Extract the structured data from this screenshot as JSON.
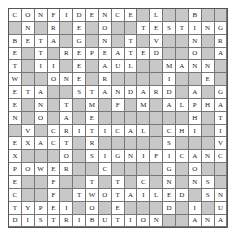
{
  "puzzle": {
    "type": "crossword",
    "rows": 17,
    "cols": 17,
    "block_color": "#c8c8c8",
    "cell_color": "#ffffff",
    "grid": [
      "CONFIDENCE#L##B##",
      "#N#R#E#O##TESTING",
      "BETA#G#N#T#V#N#R#",
      "E#T#REPEATED#O#A#",
      "T#II#E#AUL##MANN",
      "W##ONE#R#####I#E",
      "ETA##STANDARD#A#G",
      "E#N#T#M#F#M#ALPHA",
      "N#O#A#E#######H#T",
      "#V#CRITICAL#CHI#I",
      "EXACT#R######S##V",
      "X###O#SIGNIFICANCE",
      "POWER##C####G#O##",
      "E##F##T#T#C#N#NS#",
      "C##F#TWOTAILED#S#N",
      "TYPEI#O#E###D#I#U",
      "E##C##S#######G#L"
    ],
    "rows_text": [
      [
        "C",
        "O",
        "N",
        "F",
        "I",
        "D",
        "E",
        "N",
        "C",
        "E",
        "#",
        "L",
        "#",
        "#",
        "B",
        "#",
        "#"
      ],
      [
        "#",
        "N",
        "#",
        "R",
        "#",
        "E",
        "#",
        "O",
        "#",
        "#",
        "T",
        "E",
        "S",
        "T",
        "I",
        "N",
        "G"
      ],
      [
        "B",
        "E",
        "T",
        "A",
        "#",
        "G",
        "#",
        "N",
        "#",
        "T",
        "#",
        "V",
        "#",
        "#",
        "N",
        "#",
        "R"
      ],
      [
        "E",
        "#",
        "T",
        "#",
        "R",
        "E",
        "P",
        "E",
        "A",
        "T",
        "E",
        "D",
        "#",
        "#",
        "O",
        "#",
        "A"
      ],
      [
        "T",
        "#",
        "I",
        "I",
        "#",
        "E",
        "#",
        "A",
        "U",
        "L",
        "#",
        "#",
        "M",
        "A",
        "N",
        "N",
        "#"
      ],
      [
        "W",
        "#",
        "#",
        "O",
        "N",
        "E",
        "#",
        "R",
        "#",
        "#",
        "#",
        "#",
        "I",
        "#",
        "#",
        "E",
        "#"
      ],
      [
        "E",
        "T",
        "A",
        "#",
        "#",
        "S",
        "T",
        "A",
        "N",
        "D",
        "A",
        "R",
        "D",
        "#",
        "A",
        "#",
        "G"
      ],
      [
        "E",
        "#",
        "N",
        "#",
        "T",
        "#",
        "M",
        "#",
        "F",
        "#",
        "M",
        "#",
        "A",
        "L",
        "P",
        "H",
        "A"
      ],
      [
        "N",
        "#",
        "O",
        "#",
        "A",
        "#",
        "E",
        "#",
        "#",
        "#",
        "#",
        "#",
        "#",
        "#",
        "H",
        "#",
        "T"
      ],
      [
        "#",
        "V",
        "#",
        "C",
        "R",
        "I",
        "T",
        "I",
        "C",
        "A",
        "L",
        "#",
        "C",
        "H",
        "I",
        "#",
        "I"
      ],
      [
        "E",
        "X",
        "A",
        "C",
        "T",
        "#",
        "R",
        "#",
        "#",
        "#",
        "#",
        "#",
        "S",
        "#",
        "#",
        "#",
        "V"
      ],
      [
        "X",
        "#",
        "#",
        "#",
        "O",
        "#",
        "S",
        "I",
        "G",
        "N",
        "I",
        "F",
        "I",
        "C",
        "A",
        "N",
        "C"
      ],
      [
        "P",
        "O",
        "W",
        "E",
        "R",
        "#",
        "#",
        "C",
        "#",
        "#",
        "#",
        "#",
        "G",
        "#",
        "O",
        "#",
        "#"
      ],
      [
        "E",
        "#",
        "#",
        "F",
        "#",
        "#",
        "T",
        "#",
        "T",
        "#",
        "C",
        "#",
        "N",
        "#",
        "N",
        "S",
        "#"
      ],
      [
        "C",
        "#",
        "#",
        "F",
        "#",
        "T",
        "W",
        "O",
        "T",
        "A",
        "I",
        "L",
        "E",
        "D",
        "#",
        "S",
        "N"
      ],
      [
        "T",
        "Y",
        "P",
        "E",
        "I",
        "#",
        "O",
        "#",
        "E",
        "#",
        "#",
        "#",
        "D",
        "#",
        "I",
        "#",
        "U"
      ],
      [
        "E",
        "#",
        "#",
        "C",
        "#",
        "#",
        "S",
        "#",
        "#",
        "#",
        "#",
        "#",
        "#",
        "#",
        "G",
        "#",
        "L"
      ]
    ],
    "last_row": [
      "D",
      "I",
      "S",
      "T",
      "R",
      "I",
      "B",
      "U",
      "T",
      "I",
      "O",
      "N",
      "#",
      "#",
      "A",
      "N",
      "A",
      "L"
    ],
    "visible_words": {
      "across": [
        "CONFIDENCE",
        "TESTING",
        "BETA",
        "REPEATED",
        "MANN",
        "ONE",
        "ETA",
        "STANDARD",
        "ALPHA",
        "CRITICAL",
        "CHI",
        "EXACT",
        "SIGNIFICANCE",
        "POWER",
        "TWOTAILED",
        "TYPEI",
        "DISTRIBUTION",
        "ANAL"
      ],
      "down": [
        "BETWEEN",
        "NONE",
        "FRA",
        "DEGREE",
        "NOMINAL",
        "LEVEL",
        "BINOMIAL",
        "GRAND",
        "NEGATIVE",
        "TEST",
        "TIE",
        "INVERSE",
        "EXPECTED",
        "NULL",
        "SIGN",
        "SIGNIFICANT"
      ]
    }
  }
}
